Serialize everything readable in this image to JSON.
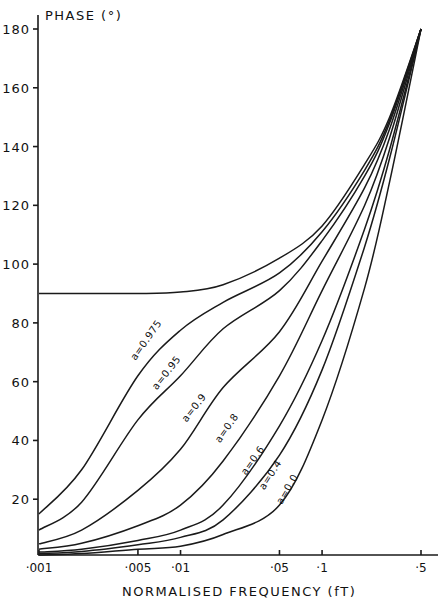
{
  "chart_data": {
    "type": "line",
    "title": "",
    "xlabel": "NORMALISED FREQUENCY (fT)",
    "ylabel": "PHASE (°)",
    "xscale": "log",
    "xlim": [
      0.001,
      0.5
    ],
    "ylim": [
      0,
      180
    ],
    "grid": false,
    "legend": "inline curve labels",
    "y_ticks": [
      20,
      40,
      60,
      80,
      100,
      120,
      140,
      160,
      180
    ],
    "y_tick_labels": [
      "20",
      "40",
      "60",
      "80",
      "100",
      "120",
      "140",
      "160",
      "180"
    ],
    "x_ticks": [
      0.001,
      0.005,
      0.01,
      0.05,
      0.1,
      0.5
    ],
    "x_tick_labels": [
      "·001",
      "·005",
      "·01",
      "·05",
      "·1",
      "·5"
    ],
    "x": [
      0.001,
      0.002,
      0.005,
      0.01,
      0.02,
      0.05,
      0.1,
      0.2,
      0.3,
      0.5
    ],
    "series": [
      {
        "name": "a=1.0 (unlabeled)",
        "label": "",
        "values": [
          90,
          90,
          90,
          90.5,
          93,
          102,
          113,
          134,
          150,
          180
        ]
      },
      {
        "name": "a=0.975",
        "label": "a=0.975",
        "values": [
          15,
          30,
          62,
          77.5,
          87,
          97,
          111,
          132,
          149,
          180
        ]
      },
      {
        "name": "a=0.95",
        "label": "a=0.95",
        "values": [
          9.5,
          19,
          47,
          62,
          78,
          91,
          108,
          130,
          148,
          180
        ]
      },
      {
        "name": "a=0.9",
        "label": "a=0.9",
        "values": [
          4.8,
          9.5,
          23,
          37,
          58,
          77,
          101,
          126,
          146,
          180
        ]
      },
      {
        "name": "a=0.8",
        "label": "a=0.8",
        "values": [
          3,
          5,
          11,
          18,
          33,
          62,
          91,
          120,
          143,
          180
        ]
      },
      {
        "name": "a=0.6",
        "label": "a=0.6",
        "values": [
          2,
          3,
          6,
          9.5,
          18,
          45,
          74,
          112,
          139,
          180
        ]
      },
      {
        "name": "a=0.4",
        "label": "a=0.4",
        "values": [
          1.5,
          2.2,
          4.5,
          7,
          13,
          35,
          64,
          106,
          136,
          180
        ]
      },
      {
        "name": "a=0.0",
        "label": "a=0.0",
        "values": [
          1,
          1.5,
          3,
          4,
          8,
          18,
          47,
          92,
          128,
          180
        ]
      }
    ],
    "curve_label_positions": [
      {
        "label": "a=0.975",
        "f": 0.0048,
        "deg": 67,
        "angle": -55
      },
      {
        "label": "a=0.95",
        "f": 0.0068,
        "deg": 57,
        "angle": -52
      },
      {
        "label": "a=0.9",
        "f": 0.011,
        "deg": 46,
        "angle": -52
      },
      {
        "label": "a=0.8",
        "f": 0.019,
        "deg": 39,
        "angle": -55
      },
      {
        "label": "a=0.6",
        "f": 0.029,
        "deg": 28,
        "angle": -55
      },
      {
        "label": "a=0.4",
        "f": 0.039,
        "deg": 23,
        "angle": -57
      },
      {
        "label": "a=0.0",
        "f": 0.052,
        "deg": 18,
        "angle": -60
      }
    ]
  },
  "axes": {
    "y_title": "PHASE (°)",
    "x_title": "NORMALISED FREQUENCY (fT)"
  },
  "colors": {
    "ink": "#1a1a1a",
    "background": "#ffffff"
  }
}
